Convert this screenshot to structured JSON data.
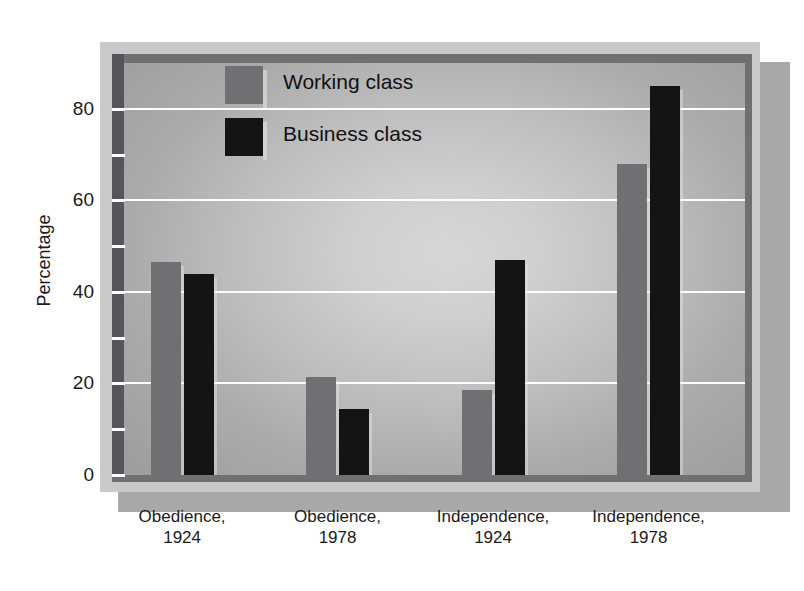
{
  "chart_data": {
    "type": "bar",
    "title": "",
    "subtitle": "",
    "xlabel": "",
    "ylabel": "Percentage",
    "ylim": [
      0,
      90
    ],
    "yticks": [
      0,
      20,
      40,
      60,
      80
    ],
    "yticks_minor": [
      10,
      30,
      50,
      70
    ],
    "grid": true,
    "legend_position": "top-center",
    "categories": [
      "Obedience, 1924",
      "Obedience, 1978",
      "Independence, 1924",
      "Independence, 1978"
    ],
    "category_lines": [
      [
        "Obedience,",
        "1924"
      ],
      [
        "Obedience,",
        "1978"
      ],
      [
        "Independence,",
        "1924"
      ],
      [
        "Independence,",
        "1978"
      ]
    ],
    "series": [
      {
        "name": "Working class",
        "color": "#6e7073",
        "values": [
          46.5,
          21.5,
          18.5,
          68
        ]
      },
      {
        "name": "Business class",
        "color": "#141414",
        "values": [
          44,
          14.5,
          47,
          85
        ]
      }
    ]
  },
  "colors": {
    "working_class": "#6e7073",
    "business_class": "#141414",
    "gridline": "#fdfdfd",
    "frame_outer": "#c9c9c9",
    "frame_inner": "#6f7072",
    "axis_spine": "#55565a",
    "shadow": "#a8a8a8",
    "text": "#1b1b1b"
  },
  "axis": {
    "ylabel": "Percentage",
    "ytick_labels": [
      "0",
      "20",
      "40",
      "60",
      "80"
    ]
  },
  "legend": {
    "items": [
      {
        "label": "Working class",
        "swatch": "working"
      },
      {
        "label": "Business class",
        "swatch": "business"
      }
    ]
  }
}
